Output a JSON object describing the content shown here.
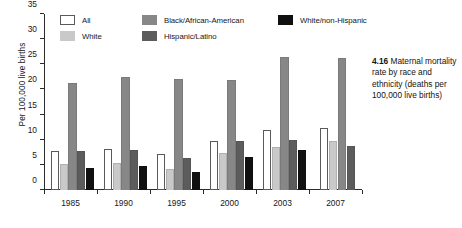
{
  "chart_data": {
    "type": "bar",
    "title": "Maternal mortality rate by race and ethnicity (deaths per 100,000 live births)",
    "xlabel": "",
    "ylabel": "Per 100,000 live births",
    "ylim": [
      0,
      35
    ],
    "ytick_labels": [
      "0",
      "5",
      "10",
      "15",
      "20",
      "25",
      "30",
      "35"
    ],
    "yticks": [
      0,
      5,
      10,
      15,
      20,
      25,
      30,
      35
    ],
    "grid": false,
    "legend_position": "top-inside",
    "categories": [
      "1985",
      "1990",
      "1995",
      "2000",
      "2003",
      "2007"
    ],
    "series": [
      {
        "name": "All",
        "color": "#ffffff",
        "values": [
          7.8,
          8.2,
          7.1,
          9.8,
          12.0,
          12.4
        ]
      },
      {
        "name": "White",
        "color": "#c9c9c9",
        "values": [
          5.2,
          5.4,
          4.2,
          7.4,
          8.5,
          9.8
        ]
      },
      {
        "name": "Black/African-American",
        "color": "#878787",
        "values": [
          21.3,
          22.4,
          22.1,
          21.9,
          26.5,
          26.2
        ]
      },
      {
        "name": "Hispanic/Latino",
        "color": "#5c5c5c",
        "values": [
          7.8,
          7.9,
          6.3,
          9.8,
          9.9,
          8.7
        ]
      },
      {
        "name": "White/non-Hispanic",
        "color": "#101010",
        "values": [
          4.3,
          4.8,
          3.5,
          6.6,
          7.9,
          null
        ]
      }
    ]
  },
  "legend": {
    "rows": [
      [
        {
          "label": "All",
          "swatch": "legend-swatch-all"
        },
        {
          "label": "Black/African-American",
          "swatch": "legend-swatch-black"
        },
        {
          "label": "White/non-Hispanic",
          "swatch": "legend-swatch-white-non-hispanic"
        }
      ],
      [
        {
          "label": "White",
          "swatch": "legend-swatch-white"
        },
        {
          "label": "Hispanic/Latino",
          "swatch": "legend-swatch-hispanic"
        }
      ]
    ]
  },
  "caption": {
    "number": "4.16",
    "text": "Maternal mortality rate by race and ethnicity (deaths per 100,000 live births)"
  }
}
